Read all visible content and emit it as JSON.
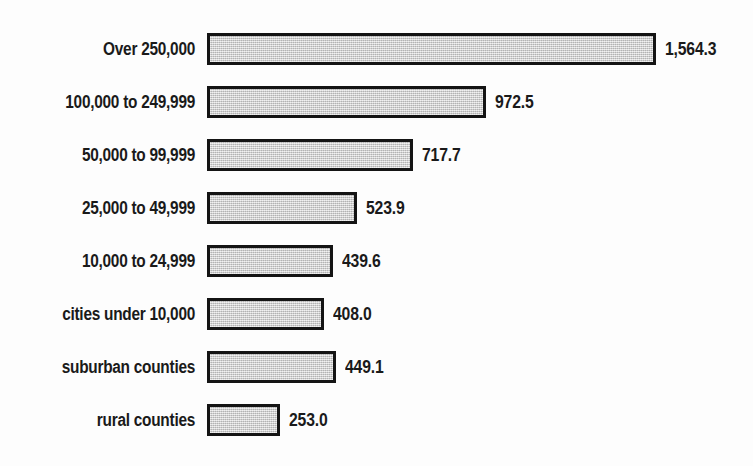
{
  "chart_data": {
    "type": "bar",
    "orientation": "horizontal",
    "title": "",
    "subtitle": "",
    "xlabel": "",
    "ylabel": "",
    "grid": false,
    "legend": "none",
    "axis_visible": false,
    "xlim": [
      0,
      1564.3
    ],
    "value_label_format": "comma-one-decimal",
    "categories": [
      "Over 250,000",
      "100,000 to 249,999",
      "50,000 to 99,999",
      "25,000 to 49,999",
      "10,000 to 24,999",
      "cities under 10,000",
      "suburban counties",
      "rural counties"
    ],
    "values": [
      1564.3,
      972.5,
      717.7,
      523.9,
      439.6,
      408.0,
      449.1,
      253.0
    ],
    "value_labels": [
      "1,564.3",
      "972.5",
      "717.7",
      "523.9",
      "439.6",
      "408.0",
      "449.1",
      "253.0"
    ],
    "bar_fill_color": "#c9c9c9",
    "bar_border_color": "#141414",
    "text_color": "#1a1a1a",
    "background_color": "#fdfdfd"
  },
  "layout": {
    "bar_left_px": 207,
    "first_bar_top_px": 33,
    "row_pitch_px": 53,
    "bar_height_px": 32,
    "px_per_unit": 0.287,
    "value_gap_px": 9,
    "label_right_px": 195
  }
}
